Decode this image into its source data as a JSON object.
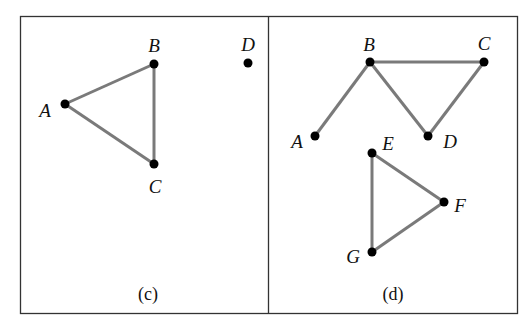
{
  "panels": [
    {
      "caption": "(c)",
      "vertices": [
        {
          "name": "A",
          "x": 65,
          "y": 104,
          "lx": 45,
          "ly": 110
        },
        {
          "name": "B",
          "x": 154,
          "y": 64,
          "lx": 154,
          "ly": 45
        },
        {
          "name": "C",
          "x": 154,
          "y": 164,
          "lx": 155,
          "ly": 186
        },
        {
          "name": "D",
          "x": 248,
          "y": 63,
          "lx": 248,
          "ly": 44
        }
      ],
      "edges": [
        [
          "A",
          "B"
        ],
        [
          "B",
          "C"
        ],
        [
          "A",
          "C"
        ]
      ]
    },
    {
      "caption": "(d)",
      "vertices": [
        {
          "name": "A",
          "x": 315,
          "y": 136,
          "lx": 297,
          "ly": 141
        },
        {
          "name": "B",
          "x": 370,
          "y": 62,
          "lx": 369,
          "ly": 44
        },
        {
          "name": "C",
          "x": 484,
          "y": 62,
          "lx": 484,
          "ly": 43
        },
        {
          "name": "D",
          "x": 428,
          "y": 136,
          "lx": 450,
          "ly": 141
        },
        {
          "name": "E",
          "x": 372,
          "y": 153,
          "lx": 388,
          "ly": 143
        },
        {
          "name": "F",
          "x": 444,
          "y": 202,
          "lx": 460,
          "ly": 205
        },
        {
          "name": "G",
          "x": 372,
          "y": 252,
          "lx": 353,
          "ly": 256
        }
      ],
      "edges": [
        [
          "A",
          "B"
        ],
        [
          "B",
          "C"
        ],
        [
          "B",
          "D"
        ],
        [
          "C",
          "D"
        ],
        [
          "E",
          "F"
        ],
        [
          "F",
          "G"
        ],
        [
          "E",
          "G"
        ]
      ]
    }
  ],
  "colors": {
    "edge": "#7a7a7a",
    "vertex": "#000000",
    "frame": "#333333"
  }
}
